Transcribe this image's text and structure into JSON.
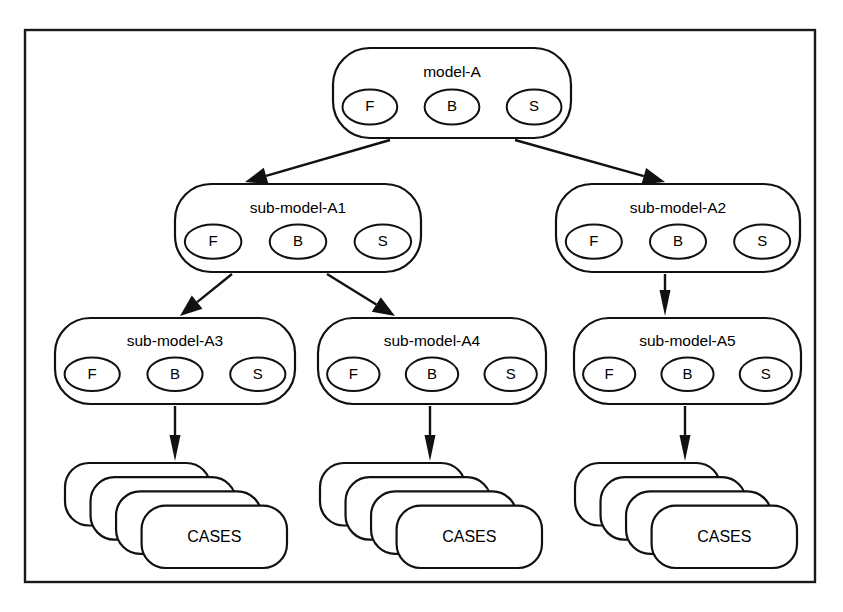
{
  "diagram": {
    "frame": {
      "x": 25,
      "y": 30,
      "width": 790,
      "height": 552
    },
    "colors": {
      "stroke": "#111111",
      "frame_stroke": "#1a1a1a",
      "fill": "#ffffff",
      "text": "#000000"
    },
    "component_labels": {
      "f": "F",
      "b": "B",
      "s": "S"
    },
    "nodes": [
      {
        "id": "model-A",
        "label": "model-A",
        "x": 333,
        "y": 48,
        "width": 238,
        "height": 90,
        "components": [
          "F",
          "B",
          "S"
        ]
      },
      {
        "id": "sub-model-A1",
        "label": "sub-model-A1",
        "x": 175,
        "y": 184,
        "width": 246,
        "height": 88,
        "components": [
          "F",
          "B",
          "S"
        ]
      },
      {
        "id": "sub-model-A2",
        "label": "sub-model-A2",
        "x": 556,
        "y": 184,
        "width": 244,
        "height": 88,
        "components": [
          "F",
          "B",
          "S"
        ]
      },
      {
        "id": "sub-model-A3",
        "label": "sub-model-A3",
        "x": 55,
        "y": 318,
        "width": 240,
        "height": 86,
        "components": [
          "F",
          "B",
          "S"
        ]
      },
      {
        "id": "sub-model-A4",
        "label": "sub-model-A4",
        "x": 318,
        "y": 318,
        "width": 228,
        "height": 86,
        "components": [
          "F",
          "B",
          "S"
        ]
      },
      {
        "id": "sub-model-A5",
        "label": "sub-model-A5",
        "x": 574,
        "y": 318,
        "width": 227,
        "height": 86,
        "components": [
          "F",
          "B",
          "S"
        ]
      }
    ],
    "case_stacks": [
      {
        "id": "cases-1",
        "label": "CASES",
        "x": 65,
        "y": 463,
        "width": 222,
        "height": 105,
        "layers": 4
      },
      {
        "id": "cases-2",
        "label": "CASES",
        "x": 320,
        "y": 463,
        "width": 222,
        "height": 105,
        "layers": 4
      },
      {
        "id": "cases-3",
        "label": "CASES",
        "x": 575,
        "y": 463,
        "width": 222,
        "height": 105,
        "layers": 4
      }
    ],
    "edges": [
      {
        "id": "edge-modelA-to-A1",
        "from": "model-A",
        "to": "sub-model-A1",
        "x1": 390,
        "y1": 140,
        "x2": 245,
        "y2": 182,
        "kind": "diagonal"
      },
      {
        "id": "edge-modelA-to-A2",
        "from": "model-A",
        "to": "sub-model-A2",
        "x1": 515,
        "y1": 140,
        "x2": 665,
        "y2": 182,
        "kind": "diagonal"
      },
      {
        "id": "edge-A1-to-A3",
        "from": "sub-model-A1",
        "to": "sub-model-A3",
        "x1": 232,
        "y1": 274,
        "x2": 180,
        "y2": 316,
        "kind": "diagonal"
      },
      {
        "id": "edge-A1-to-A4",
        "from": "sub-model-A1",
        "to": "sub-model-A4",
        "x1": 327,
        "y1": 274,
        "x2": 395,
        "y2": 316,
        "kind": "diagonal"
      },
      {
        "id": "edge-A2-to-A5",
        "from": "sub-model-A2",
        "to": "sub-model-A5",
        "x1": 665,
        "y1": 274,
        "x2": 665,
        "y2": 316,
        "kind": "vertical"
      },
      {
        "id": "edge-A3-to-cases1",
        "from": "sub-model-A3",
        "to": "cases-1",
        "x1": 175,
        "y1": 406,
        "x2": 175,
        "y2": 461,
        "kind": "vertical"
      },
      {
        "id": "edge-A4-to-cases2",
        "from": "sub-model-A4",
        "to": "cases-2",
        "x1": 430,
        "y1": 406,
        "x2": 430,
        "y2": 461,
        "kind": "vertical"
      },
      {
        "id": "edge-A5-to-cases3",
        "from": "sub-model-A5",
        "to": "cases-3",
        "x1": 685,
        "y1": 406,
        "x2": 685,
        "y2": 461,
        "kind": "vertical"
      }
    ]
  }
}
